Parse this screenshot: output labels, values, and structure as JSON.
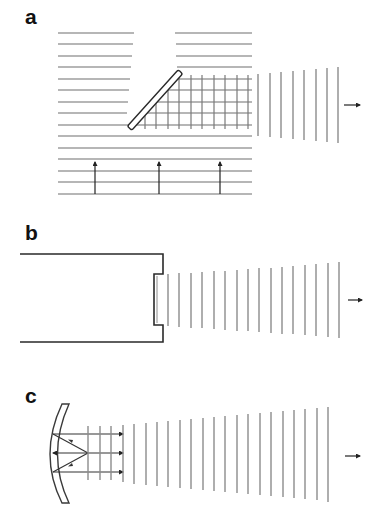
{
  "figure": {
    "panels": [
      {
        "id": "a",
        "label": "a",
        "description": "Plane wave incident from below reflected by a 45-degree plate, producing outgoing vertical wavefronts to the right",
        "incident_wavefronts": 15,
        "grid_vertical_lines": 10,
        "outgoing_wavefronts": 8,
        "incident_arrows": 3,
        "direction_arrow": "right"
      },
      {
        "id": "b",
        "label": "b",
        "description": "Waveguide / horn enclosure with recessed aperture emitting plane wavefronts to the right",
        "outgoing_wavefronts": 16,
        "direction_arrow": "right"
      },
      {
        "id": "c",
        "label": "c",
        "description": "Concave reflector with rays converging at focal point, emitting collimated wavefronts to the right",
        "rays": 3,
        "outgoing_wavefronts": 22,
        "direction_arrow": "right"
      }
    ],
    "colors": {
      "outline": "#2a2a2a",
      "wavefront": "#8c8c8c",
      "grid": "#7a7a7a",
      "arrow": "#222222",
      "background": "#ffffff"
    }
  }
}
